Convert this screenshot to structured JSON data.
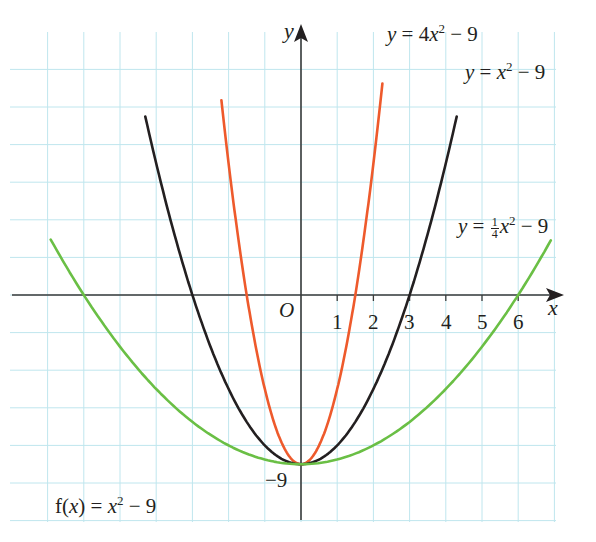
{
  "chart_data": {
    "type": "line",
    "title": "",
    "xlabel": "x",
    "ylabel": "y",
    "origin_label": "O",
    "x_tick_labels": [
      "1",
      "2",
      "3",
      "4",
      "5",
      "6"
    ],
    "y_tick_labels": [
      "−9"
    ],
    "xlim": [
      -8.0,
      7.2
    ],
    "ylim": [
      -12,
      15
    ],
    "grid": true,
    "grid_spacing": {
      "x": 1,
      "y": 2
    },
    "annotation": "f(x) = x² − 9",
    "series": [
      {
        "name": "y = 4x² − 9",
        "color": "#ee5a2c",
        "a": 4,
        "c": -9,
        "x_range": [
          -2.2,
          2.25
        ],
        "points": [
          [
            -2.0,
            7
          ],
          [
            -1.5,
            0
          ],
          [
            -1,
            -5
          ],
          [
            0,
            -9
          ],
          [
            1,
            -5
          ],
          [
            1.5,
            0
          ],
          [
            2.0,
            7
          ]
        ]
      },
      {
        "name": "y = x² − 9",
        "color": "#231f20",
        "a": 1,
        "c": -9,
        "x_range": [
          -4.3,
          4.3
        ],
        "points": [
          [
            -4,
            7
          ],
          [
            -3,
            0
          ],
          [
            -2,
            -5
          ],
          [
            0,
            -9
          ],
          [
            2,
            -5
          ],
          [
            3,
            0
          ],
          [
            4,
            7
          ]
        ]
      },
      {
        "name": "y = ¼x² − 9",
        "color": "#6abf45",
        "a": 0.25,
        "c": -9,
        "x_range": [
          -7.0,
          6.9
        ],
        "points": [
          [
            -6,
            0
          ],
          [
            -4,
            -5
          ],
          [
            -2,
            -8
          ],
          [
            0,
            -9
          ],
          [
            2,
            -8
          ],
          [
            4,
            -5
          ],
          [
            6,
            0
          ]
        ]
      }
    ]
  },
  "labels": {
    "curve_4x2": {
      "y": "y",
      "eq": " = 4",
      "x": "x",
      "exp": "2",
      "tail": " − 9"
    },
    "curve_x2": {
      "y": "y",
      "eq": " = ",
      "x": "x",
      "exp": "2",
      "tail": " − 9"
    },
    "curve_quarter": {
      "y": "y",
      "eq": " = ",
      "num": "1",
      "den": "4",
      "x": "x",
      "exp": "2",
      "tail": " − 9"
    },
    "fx": {
      "f": "f(",
      "x1": "x",
      "mid": ") = ",
      "x2": "x",
      "exp": "2",
      "tail": " − 9"
    }
  }
}
